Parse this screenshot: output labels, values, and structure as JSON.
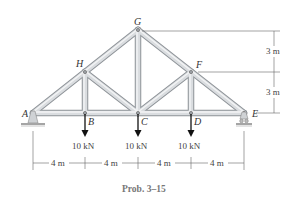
{
  "caption": "Prob. 3–15",
  "joints": {
    "A": {
      "label": "A",
      "x": 33,
      "y": 113
    },
    "B": {
      "label": "B",
      "x": 85,
      "y": 113
    },
    "C": {
      "label": "C",
      "x": 138,
      "y": 113
    },
    "D": {
      "label": "D",
      "x": 191,
      "y": 113
    },
    "E": {
      "label": "E",
      "x": 244,
      "y": 113
    },
    "F": {
      "label": "F",
      "x": 191,
      "y": 72
    },
    "G": {
      "label": "G",
      "x": 138,
      "y": 30
    },
    "H": {
      "label": "H",
      "x": 85,
      "y": 72
    }
  },
  "loads": [
    {
      "at": "B",
      "label": "10 kN"
    },
    {
      "at": "C",
      "label": "10 kN"
    },
    {
      "at": "D",
      "label": "10 kN"
    }
  ],
  "horizontal_dimensions": [
    "4 m",
    "4 m",
    "4 m",
    "4 m"
  ],
  "vertical_dimensions": [
    "3 m",
    "3 m"
  ],
  "colors": {
    "member_fill": "#d9dcdf",
    "member_edge": "#8e9398",
    "arrow": "#111111",
    "dim_line": "#666666",
    "ground": "#9a9a9a"
  }
}
